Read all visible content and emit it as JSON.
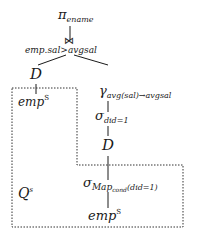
{
  "diagram": {
    "type": "query-plan-tree",
    "nodes": {
      "project": {
        "symbol": "π",
        "sub": "ename"
      },
      "join": {
        "symbol": "⋈",
        "cond": "emp.sal>avgsal"
      },
      "left_d": {
        "label": "D"
      },
      "left_emp": {
        "label": "emp",
        "sup": "S"
      },
      "groupby": {
        "symbol": "γ",
        "sub": "avg(sal)→avgsal"
      },
      "select": {
        "symbol": "σ",
        "sub": "did=1"
      },
      "right_d": {
        "label": "D"
      },
      "map_select": {
        "symbol": "σ",
        "sub_main": "Map",
        "sub_cond": "cond",
        "sub_tail": "(did=1)"
      },
      "right_emp": {
        "label": "emp",
        "sup": "S"
      }
    },
    "region_label": {
      "label": "Q",
      "sup": "s"
    },
    "colors": {
      "line": "#1a1a1a",
      "dashed": "#333333",
      "background": "#ffffff"
    }
  }
}
